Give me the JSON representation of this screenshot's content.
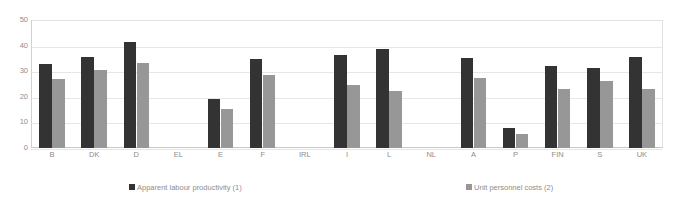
{
  "chart_data": {
    "type": "bar",
    "title": "",
    "subtitle": "",
    "xlabel": "",
    "ylabel": "",
    "ylim": [
      0,
      50
    ],
    "yticks": [
      0,
      10,
      20,
      30,
      40,
      50
    ],
    "ytick_labels": [
      "0",
      "10",
      "20",
      "30",
      "40",
      "50"
    ],
    "grid": true,
    "legend_position": "bottom",
    "categories": [
      "B",
      "DK",
      "D",
      "EL",
      "E",
      "F",
      "IRL",
      "I",
      "L",
      "NL",
      "A",
      "P",
      "FIN",
      "S",
      "UK"
    ],
    "series": [
      {
        "name": "Apparent labour productivity (1)",
        "color": "#333333",
        "values": [
          32.8,
          35.5,
          41.3,
          null,
          19.2,
          34.8,
          null,
          36.3,
          38.7,
          null,
          35.2,
          8.0,
          32.1,
          31.4,
          35.5
        ]
      },
      {
        "name": "Unit personnel costs (2)",
        "color": "#979797",
        "values": [
          26.8,
          30.3,
          33.2,
          null,
          15.3,
          28.6,
          null,
          24.8,
          22.3,
          null,
          27.2,
          5.4,
          23.2,
          26.2,
          22.9
        ]
      }
    ]
  },
  "legend": {
    "items": [
      {
        "label": "Apparent labour productivity (1)",
        "color": "#333333"
      },
      {
        "label": "Unit personnel costs (2)",
        "color": "#979797"
      }
    ]
  },
  "colors": {
    "series1": "#333333",
    "series2": "#979797",
    "gridline": "#e6e6e6",
    "axis": "#c8c8c8",
    "tick_text": "#8d8d8d",
    "background": "#ffffff"
  }
}
